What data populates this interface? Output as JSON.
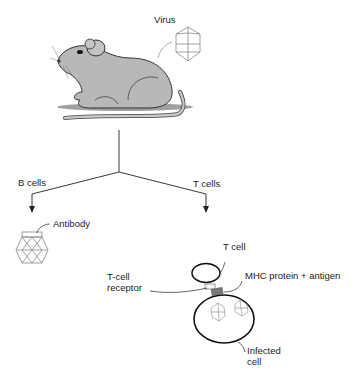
{
  "labels": {
    "virus": "Virus",
    "b_cells": "B cells",
    "t_cells": "T cells",
    "antibody": "Antibody",
    "t_cell": "T cell",
    "mhc": "MHC protein + antigen",
    "tcr_line1": "T-cell",
    "tcr_line2": "receptor",
    "infected_line1": "Infected",
    "infected_line2": "cell"
  },
  "colors": {
    "line": "#222222",
    "mouse_fill": "#b8b8b8",
    "shadow": "#9a9a9a",
    "virus": "#888888"
  }
}
